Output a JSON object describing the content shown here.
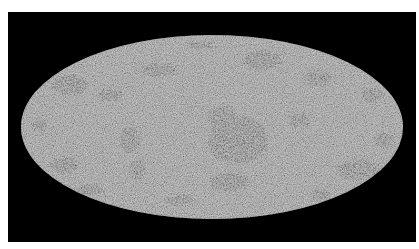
{
  "image": {
    "description": "All-sky map in Mollweide (elliptical) projection, grayscale mottled texture with dark clustered patches on black background",
    "background_color": "#000000",
    "border_color": "#ffffff",
    "map_base_color": "#8c8c8c",
    "patch_color": "#1a1a1a",
    "projection": "mollweide"
  }
}
